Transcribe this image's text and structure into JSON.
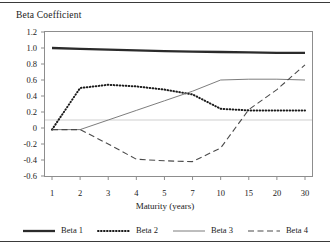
{
  "chart_data": {
    "type": "line",
    "title": "Beta Coefficient",
    "xlabel": "Maturity (years)",
    "ylabel": "",
    "categories": [
      "1",
      "2",
      "3",
      "4",
      "5",
      "7",
      "10",
      "15",
      "20",
      "30"
    ],
    "ylim": [
      -0.6,
      1.2
    ],
    "yticks": [
      "1.2",
      "1.0",
      "0.8",
      "0.6",
      "0.4",
      "0.2",
      "0",
      "-0.2",
      "-0.4",
      "-0.6"
    ],
    "ytick_values": [
      1.2,
      1.0,
      0.8,
      0.6,
      0.4,
      0.2,
      0,
      -0.2,
      -0.4,
      -0.6
    ],
    "grid": false,
    "zero_line": true,
    "legend_position": "bottom",
    "series": [
      {
        "name": "Beta 1",
        "style": "solid-thick",
        "color": "#2b2b2b",
        "values": [
          1.0,
          0.99,
          0.98,
          0.97,
          0.96,
          0.955,
          0.95,
          0.945,
          0.94,
          0.94
        ]
      },
      {
        "name": "Beta 2",
        "style": "dotted",
        "color": "#1a1a1a",
        "values": [
          -0.02,
          0.5,
          0.54,
          0.52,
          0.48,
          0.42,
          0.24,
          0.22,
          0.22,
          0.22
        ]
      },
      {
        "name": "Beta 3",
        "style": "solid-thin",
        "color": "#6e6e6e",
        "values": [
          -0.02,
          -0.02,
          0.1,
          0.22,
          0.34,
          0.46,
          0.6,
          0.61,
          0.61,
          0.6
        ]
      },
      {
        "name": "Beta 4",
        "style": "dashed",
        "color": "#4a4a4a",
        "values": [
          -0.02,
          -0.02,
          -0.2,
          -0.39,
          -0.41,
          -0.42,
          -0.25,
          0.23,
          0.48,
          0.79
        ]
      }
    ]
  },
  "legend": {
    "items": [
      {
        "label": "Beta 1",
        "swatch": "solid-thick-swatch"
      },
      {
        "label": "Beta 2",
        "swatch": "dotted-swatch"
      },
      {
        "label": "Beta 3",
        "swatch": "solid-thin-swatch"
      },
      {
        "label": "Beta 4",
        "swatch": "dashed-swatch"
      }
    ]
  }
}
